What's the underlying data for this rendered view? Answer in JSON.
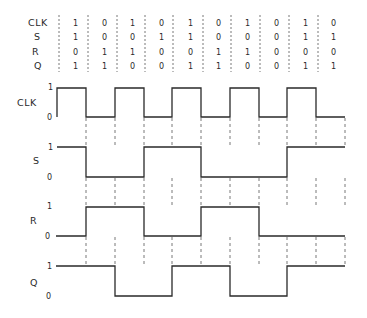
{
  "truth_table": {
    "rows": [
      {
        "label": "CLK",
        "values": [
          "1",
          "0",
          "1",
          "0",
          "1",
          "0",
          "1",
          "0",
          "1",
          "0"
        ]
      },
      {
        "label": "S",
        "values": [
          "1",
          "0",
          "0",
          "1",
          "1",
          "0",
          "0",
          "0",
          "1",
          "1"
        ]
      },
      {
        "label": "R",
        "values": [
          "0",
          "1",
          "1",
          "0",
          "0",
          "1",
          "1",
          "0",
          "0",
          "0"
        ]
      },
      {
        "label": "Q",
        "values": [
          "1",
          "1",
          "0",
          "0",
          "1",
          "1",
          "0",
          "0",
          "1",
          "1"
        ]
      }
    ]
  },
  "waveforms": [
    {
      "label": "CLK",
      "high_label": "1",
      "low_label": "0",
      "levels": [
        1,
        0,
        1,
        0,
        1,
        0,
        1,
        0,
        1,
        0
      ]
    },
    {
      "label": "S",
      "high_label": "1",
      "low_label": "0",
      "levels": [
        1,
        0,
        0,
        1,
        1,
        0,
        0,
        0,
        1,
        1
      ]
    },
    {
      "label": "R",
      "high_label": "1",
      "low_label": "0",
      "levels": [
        0,
        1,
        1,
        0,
        0,
        1,
        1,
        0,
        0,
        0
      ]
    },
    {
      "label": "Q",
      "high_label": "1",
      "low_label": "0",
      "levels": [
        1,
        1,
        0,
        0,
        1,
        1,
        0,
        0,
        1,
        1
      ]
    }
  ],
  "colors": {
    "line": "#2a2a2a",
    "dash": "#555555",
    "background": "#ffffff"
  }
}
